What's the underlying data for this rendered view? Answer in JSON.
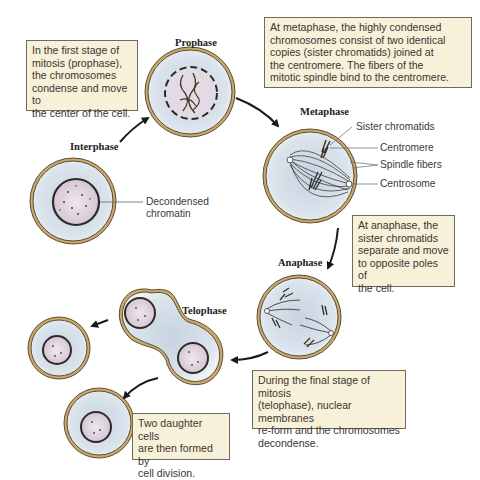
{
  "diagram": {
    "colors": {
      "cytoplasm": "#d6e1ea",
      "cell_wall_outer": "#6b5a40",
      "cell_wall_fill": "#c9a86a",
      "nucleus": "#d9cdd6",
      "callout_bg": "#f8f1da",
      "callout_border": "#6e6a60",
      "arrow": "#1a1a1a"
    },
    "phases": {
      "interphase": "Interphase",
      "prophase": "Prophase",
      "metaphase": "Metaphase",
      "anaphase": "Anaphase",
      "telophase": "Telophase"
    },
    "labels": {
      "decondensed_chromatin": [
        "Decondensed",
        "chromatin"
      ],
      "sister_chromatids": "Sister chromatids",
      "centromere": "Centromere",
      "spindle_fibers": "Spindle fibers",
      "centrosome": "Centrosome"
    },
    "callouts": {
      "prophase": [
        "In the first stage of",
        "mitosis (prophase),",
        "the chromosomes",
        "condense and move to",
        "the center of the cell."
      ],
      "metaphase": [
        "At metaphase, the highly condensed",
        "chromosomes consist of two identical",
        "copies (sister chromatids) joined at",
        "the centromere. The fibers of the",
        "mitotic spindle bind to the centromere."
      ],
      "anaphase": [
        "At anaphase, the",
        "sister chromatids",
        "separate and move",
        "to opposite poles of",
        "the cell."
      ],
      "telophase": [
        "During the final stage of mitosis",
        "(telophase), nuclear membranes",
        "re-form and the chromosomes",
        "decondense."
      ],
      "daughter": [
        "Two daughter cells",
        "are then formed by",
        "cell division."
      ]
    }
  }
}
